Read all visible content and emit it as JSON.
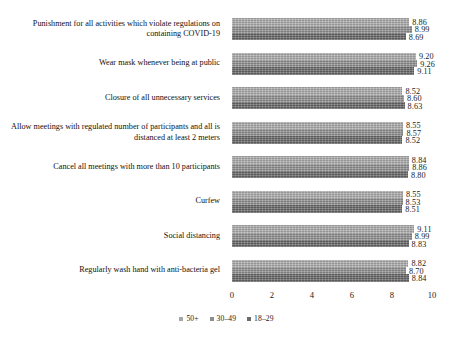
{
  "chart_data": {
    "type": "bar",
    "orientation": "horizontal",
    "title": "",
    "subtitle": "",
    "xlabel": "",
    "ylabel": "",
    "xlim": [
      0,
      10
    ],
    "xticks": [
      "0",
      "2",
      "4",
      "6",
      "8",
      "10"
    ],
    "grid": false,
    "legend_position": "bottom-center",
    "categories": [
      "Punishment for all activities which violate regulations on containing COVID-19",
      "Wear mask whenever being at public",
      "Closure of all unnecessary services",
      "Allow meetings with regulated number of participants and all is distanced at least 2 meters",
      "Cancel all meetings with more than 10 participants",
      "Curfew",
      "Social distancing",
      "Regularly wash hand with  anti-bacteria gel"
    ],
    "series": [
      {
        "name": "50+",
        "color": "#a6a6a6",
        "values": [
          8.86,
          9.2,
          8.52,
          8.55,
          8.84,
          8.55,
          9.11,
          8.82
        ],
        "labels": [
          "8.86",
          "9.20",
          "8.52",
          "8.55",
          "8.84",
          "8.55",
          "9.11",
          "8.82"
        ]
      },
      {
        "name": "30–49",
        "color": "#8e8e8e",
        "values": [
          8.99,
          9.26,
          8.6,
          8.57,
          8.86,
          8.53,
          8.99,
          8.7
        ],
        "labels": [
          "8.99",
          "9.26",
          "8.60",
          "8.57",
          "8.86",
          "8.53",
          "8.99",
          "8.70"
        ]
      },
      {
        "name": "18–29",
        "color": "#6b6b6b",
        "values": [
          8.69,
          9.11,
          8.63,
          8.52,
          8.8,
          8.51,
          8.83,
          8.84
        ],
        "labels": [
          "8.69",
          "9.11",
          "8.63",
          "8.52",
          "8.80",
          "8.51",
          "8.83",
          "8.84"
        ]
      }
    ]
  },
  "legend": {
    "items": [
      {
        "label": "50+"
      },
      {
        "label": "30–49"
      },
      {
        "label": "18–29"
      }
    ]
  }
}
